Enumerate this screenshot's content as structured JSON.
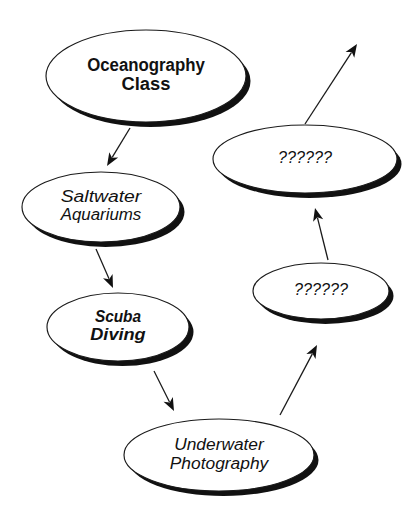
{
  "diagram": {
    "background_color": "#ffffff",
    "ink_color": "#111111",
    "shadow_color": "#111111",
    "nodes": [
      {
        "id": "oceanography-class",
        "label_line1": "Oceanography",
        "label_line2": "Class",
        "style": "bold",
        "cx": 146,
        "cy": 76,
        "rx": 100,
        "ry": 46,
        "font_size": 17.5,
        "line_gap": 19
      },
      {
        "id": "saltwater-aquariums",
        "label_line1": "Saltwater",
        "label_line2": "Aquariums",
        "style": "italic",
        "cx": 101,
        "cy": 207,
        "rx": 79,
        "ry": 35,
        "font_size": 16,
        "line_gap": 18
      },
      {
        "id": "scuba-diving",
        "label_line1": "Scuba",
        "label_line2": "Diving",
        "style": "bold-italic",
        "cx": 118,
        "cy": 327,
        "rx": 71,
        "ry": 34,
        "font_size": 16.5,
        "line_gap": 18
      },
      {
        "id": "underwater-photography",
        "label_line1": "Underwater",
        "label_line2": "Photography",
        "style": "italic",
        "cx": 219,
        "cy": 455,
        "rx": 95,
        "ry": 36,
        "font_size": 16,
        "line_gap": 19
      },
      {
        "id": "unknown-lower",
        "label_line1": "??????",
        "label_line2": "",
        "style": "italic",
        "cx": 321,
        "cy": 291,
        "rx": 68,
        "ry": 28,
        "font_size": 16,
        "line_gap": 0
      },
      {
        "id": "unknown-upper",
        "label_line1": "??????",
        "label_line2": "",
        "style": "italic",
        "cx": 305,
        "cy": 159,
        "rx": 92,
        "ry": 34,
        "font_size": 16,
        "line_gap": 0
      }
    ],
    "edges": [
      {
        "id": "edge-oceanography-to-saltwater",
        "from": "oceanography-class",
        "to": "saltwater-aquariums",
        "x1": 130,
        "y1": 128,
        "x2": 107,
        "y2": 166
      },
      {
        "id": "edge-saltwater-to-scuba",
        "from": "saltwater-aquariums",
        "to": "scuba-diving",
        "x1": 96,
        "y1": 249,
        "x2": 113,
        "y2": 288
      },
      {
        "id": "edge-scuba-to-underwater",
        "from": "scuba-diving",
        "to": "underwater-photography",
        "x1": 154,
        "y1": 371,
        "x2": 174,
        "y2": 411
      },
      {
        "id": "edge-underwater-to-unknown-lower",
        "from": "underwater-photography",
        "to": "unknown-lower",
        "x1": 280,
        "y1": 415,
        "x2": 317,
        "y2": 345
      },
      {
        "id": "edge-unknown-lower-to-unknown-upper",
        "from": "unknown-lower",
        "to": "unknown-upper",
        "x1": 328,
        "y1": 260,
        "x2": 315,
        "y2": 208
      },
      {
        "id": "edge-unknown-upper-to-offscreen",
        "from": "unknown-upper",
        "to": "offscreen",
        "x1": 305,
        "y1": 124,
        "x2": 357,
        "y2": 44
      }
    ]
  }
}
